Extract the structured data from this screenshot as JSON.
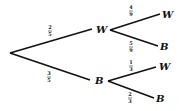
{
  "diagram": {
    "type": "probability-tree",
    "root": {
      "branches": [
        {
          "prob_num": "2",
          "prob_den": "5",
          "label": "W",
          "branches": [
            {
              "prob_num": "4",
              "prob_den": "9",
              "label": "W"
            },
            {
              "prob_num": "5",
              "prob_den": "9",
              "label": "B"
            }
          ]
        },
        {
          "prob_num": "3",
          "prob_den": "5",
          "label": "B",
          "branches": [
            {
              "prob_num": "1",
              "prob_den": "3",
              "label": "W"
            },
            {
              "prob_num": "2",
              "prob_den": "3",
              "label": "B"
            }
          ]
        }
      ]
    }
  }
}
